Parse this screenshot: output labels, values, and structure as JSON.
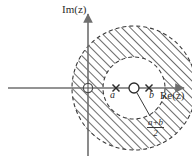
{
  "figure": {
    "axes": {
      "imaginary_label": "Im(z)",
      "real_label": "Re(z)",
      "origin_marker": "circled-cross"
    },
    "points": [
      {
        "name": "a",
        "label": "a",
        "marker": "cross",
        "x_px": 116,
        "y_px": 88
      },
      {
        "name": "b",
        "label": "b",
        "marker": "cross",
        "x_px": 152,
        "y_px": 88
      },
      {
        "name": "midpoint",
        "label": "",
        "marker": "circle",
        "x_px": 134,
        "y_px": 88
      }
    ],
    "annotation": {
      "numerator": "a+b",
      "denominator": "2",
      "leader": "line from midpoint marker to fraction label"
    },
    "region": {
      "type": "annulus",
      "center_px": [
        134,
        88
      ],
      "outer_radius_px": 62,
      "inner_radius_px": 31,
      "outer_stroke": "dashed",
      "inner_stroke": "dashed",
      "hatch_angle_deg": 45,
      "hatch_color": "#3c3c3c",
      "fill": "#ffffff"
    },
    "colors": {
      "axis": "#6f6f6f",
      "stroke": "#3a3a3a",
      "text": "#2b2b2b",
      "background": "#ffffff"
    }
  }
}
